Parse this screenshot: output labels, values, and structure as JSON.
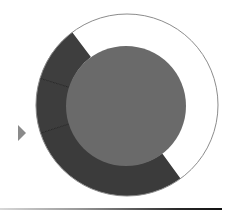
{
  "diagram": {
    "type": "donut",
    "center": {
      "x": 127,
      "y": 105
    },
    "outer_radius": 91,
    "inner_radius": 60,
    "outline_color": "#8c8c8c",
    "center_fill": "#6a6a6a",
    "segments": [
      {
        "name": "white-segment",
        "start_deg": 323,
        "end_deg": 504,
        "fill": "#ffffff"
      },
      {
        "name": "dark-bottom-segment",
        "start_deg": 144,
        "end_deg": 252,
        "fill": "#3b3b3b"
      },
      {
        "name": "dark-middle-segment",
        "start_deg": 252,
        "end_deg": 287,
        "fill": "#3d3d3d"
      },
      {
        "name": "dark-upper-segment",
        "start_deg": 287,
        "end_deg": 323,
        "fill": "#3e3e3e"
      }
    ],
    "divider_color": "#2a2a2a"
  },
  "marker": {
    "shape": "triangle-right",
    "color": "#8a8a8a"
  },
  "rule": {
    "gradient": [
      "#d8d8d8",
      "#111111"
    ]
  }
}
